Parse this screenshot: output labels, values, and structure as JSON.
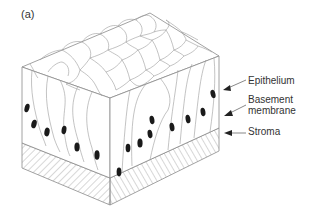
{
  "figure": {
    "panel_label": "(a)",
    "labels": {
      "epithelium": "Epithelium",
      "basement_membrane": "Basement membrane",
      "stroma": "Stroma"
    },
    "colors": {
      "line": "#8a8a8a",
      "nucleus": "#1a1a1a",
      "text": "#333333",
      "background": "#ffffff"
    }
  }
}
